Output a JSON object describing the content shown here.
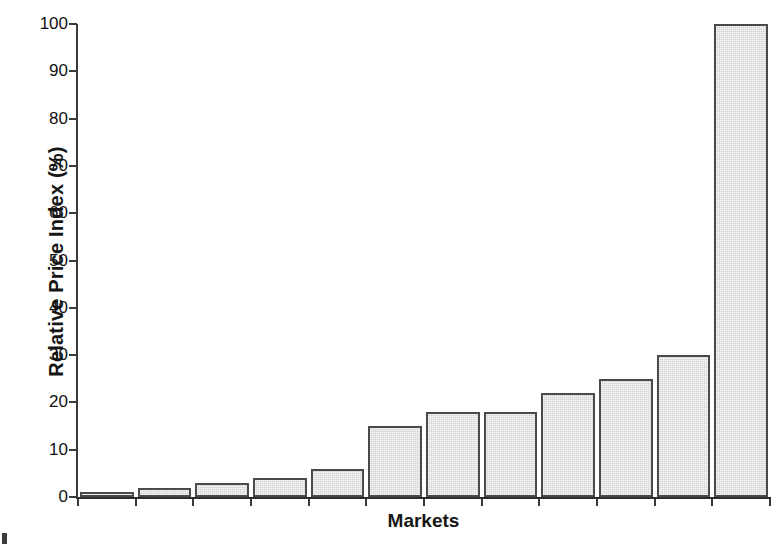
{
  "chart_data": {
    "type": "bar",
    "title": "",
    "xlabel": "Markets",
    "ylabel": "Relative Price Index (%)",
    "categories": [
      "1",
      "2",
      "3",
      "4",
      "5",
      "6",
      "7",
      "8",
      "9",
      "10",
      "11",
      "12"
    ],
    "values": [
      1,
      2,
      3,
      4,
      6,
      15,
      18,
      18,
      22,
      25,
      30,
      100
    ],
    "ylim": [
      0,
      100
    ],
    "ytick_labels": [
      "0",
      "10",
      "20",
      "30",
      "40",
      "50",
      "60",
      "70",
      "80",
      "90",
      "100"
    ],
    "ytick_values": [
      0,
      10,
      20,
      30,
      40,
      50,
      60,
      70,
      80,
      90,
      100
    ],
    "xtick_labels": [],
    "grid": false,
    "legend": false,
    "bar_fill_color": "#d2d2d2",
    "bar_edge_color": "#4a4a4a",
    "axis_color": "#3a3a3a",
    "background_color": "#ffffff"
  }
}
